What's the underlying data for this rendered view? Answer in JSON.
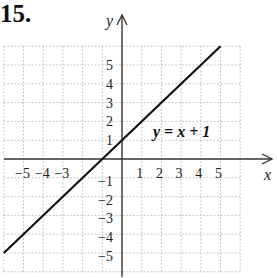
{
  "problem_number": "15.",
  "chart_data": {
    "type": "line",
    "title": "",
    "xlabel": "x",
    "ylabel": "y",
    "xlim": [
      -6,
      6
    ],
    "ylim": [
      -6,
      6
    ],
    "grid": true,
    "x_ticks": [
      -5,
      -4,
      -3,
      1,
      2,
      3,
      4,
      5
    ],
    "x_tick_labels": [
      "−5",
      "−4",
      "−3",
      "1",
      "2",
      "3",
      "4",
      "5"
    ],
    "y_ticks": [
      5,
      4,
      3,
      2,
      1,
      -1,
      -2,
      -3,
      -4,
      -5
    ],
    "y_tick_labels": [
      "5",
      "4",
      "3",
      "2",
      "1",
      "−1",
      "−2",
      "−3",
      "−4",
      "−5"
    ],
    "series": [
      {
        "name": "y = x + 1",
        "equation": "y = x + 1",
        "x": [
          -6,
          5
        ],
        "y": [
          -5,
          6
        ],
        "color": "#111111"
      }
    ],
    "annotations": [
      {
        "text": "y = x + 1",
        "x": 3.2,
        "y": 1.2
      }
    ]
  }
}
